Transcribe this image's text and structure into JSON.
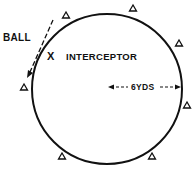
{
  "diagram": {
    "labels": {
      "ball": "BALL",
      "interceptor_mark": "X",
      "interceptor": "INTERCEPTOR",
      "radius": "6YDS"
    },
    "circle": {
      "cx": 107,
      "cy": 89,
      "r": 75,
      "stroke": "#111111"
    },
    "markers": [
      {
        "name": "player-1",
        "symbol": "triangle",
        "x": 66,
        "y": 16
      },
      {
        "name": "player-2",
        "symbol": "triangle",
        "x": 133,
        "y": 8
      },
      {
        "name": "player-3",
        "symbol": "triangle",
        "x": 179,
        "y": 43
      },
      {
        "name": "player-4",
        "symbol": "triangle",
        "x": 24,
        "y": 87
      },
      {
        "name": "player-5",
        "symbol": "triangle",
        "x": 187,
        "y": 105
      },
      {
        "name": "player-6",
        "symbol": "triangle",
        "x": 62,
        "y": 156
      },
      {
        "name": "player-7",
        "symbol": "triangle",
        "x": 152,
        "y": 156
      }
    ]
  }
}
